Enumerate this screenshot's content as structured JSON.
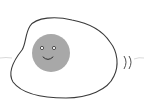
{
  "illustration": {
    "subject": "fried egg with smiling yolk",
    "colors": {
      "background": "#ffffff",
      "egg_white": "#ffffff",
      "outline": "#3a3a3a",
      "yolk": "#a8a8a8",
      "face": "#2e2e2e",
      "eye_fill": "#ffffff",
      "steam_line": "#c8c8c8"
    }
  }
}
